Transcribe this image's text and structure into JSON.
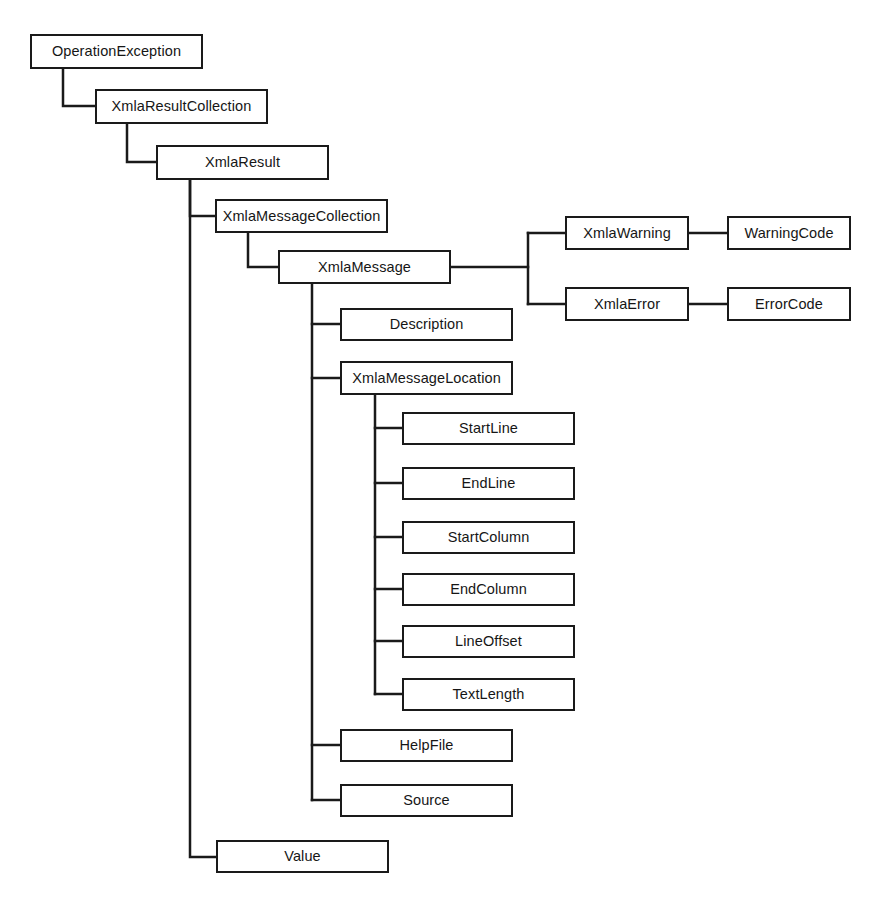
{
  "diagram": {
    "kind": "class-hierarchy-tree",
    "background_color": "#ffffff",
    "line_color": "#1a1a1a",
    "box_border_color": "#1a1a1a",
    "box_fill_color": "#ffffff",
    "text_color": "#161616",
    "nodes": [
      {
        "id": "operation-exception",
        "label": "OperationException",
        "x": 30,
        "y": 34,
        "w": 173,
        "h": 35
      },
      {
        "id": "xmla-result-collection",
        "label": "XmlaResultCollection",
        "x": 95,
        "y": 89,
        "w": 173,
        "h": 35
      },
      {
        "id": "xmla-result",
        "label": "XmlaResult",
        "x": 156,
        "y": 145,
        "w": 173,
        "h": 35
      },
      {
        "id": "xmla-message-collection",
        "label": "XmlaMessageCollection",
        "x": 215,
        "y": 199,
        "w": 173,
        "h": 34
      },
      {
        "id": "xmla-message",
        "label": "XmlaMessage",
        "x": 278,
        "y": 250,
        "w": 173,
        "h": 34
      },
      {
        "id": "xmla-warning",
        "label": "XmlaWarning",
        "x": 565,
        "y": 216,
        "w": 124,
        "h": 34
      },
      {
        "id": "warning-code",
        "label": "WarningCode",
        "x": 727,
        "y": 216,
        "w": 124,
        "h": 34
      },
      {
        "id": "xmla-error",
        "label": "XmlaError",
        "x": 565,
        "y": 287,
        "w": 124,
        "h": 34
      },
      {
        "id": "error-code",
        "label": "ErrorCode",
        "x": 727,
        "y": 287,
        "w": 124,
        "h": 34
      },
      {
        "id": "description",
        "label": "Description",
        "x": 340,
        "y": 308,
        "w": 173,
        "h": 33
      },
      {
        "id": "xmla-message-location",
        "label": "XmlaMessageLocation",
        "x": 340,
        "y": 361,
        "w": 173,
        "h": 34
      },
      {
        "id": "start-line",
        "label": "StartLine",
        "x": 402,
        "y": 412,
        "w": 173,
        "h": 33
      },
      {
        "id": "end-line",
        "label": "EndLine",
        "x": 402,
        "y": 467,
        "w": 173,
        "h": 33
      },
      {
        "id": "start-column",
        "label": "StartColumn",
        "x": 402,
        "y": 521,
        "w": 173,
        "h": 33
      },
      {
        "id": "end-column",
        "label": "EndColumn",
        "x": 402,
        "y": 573,
        "w": 173,
        "h": 33
      },
      {
        "id": "line-offset",
        "label": "LineOffset",
        "x": 402,
        "y": 625,
        "w": 173,
        "h": 33
      },
      {
        "id": "text-length",
        "label": "TextLength",
        "x": 402,
        "y": 678,
        "w": 173,
        "h": 33
      },
      {
        "id": "help-file",
        "label": "HelpFile",
        "x": 340,
        "y": 729,
        "w": 173,
        "h": 33
      },
      {
        "id": "source",
        "label": "Source",
        "x": 340,
        "y": 784,
        "w": 173,
        "h": 33
      },
      {
        "id": "value",
        "label": "Value",
        "x": 216,
        "y": 840,
        "w": 173,
        "h": 33
      }
    ],
    "connectors": [
      {
        "id": "operation-exception-to-xmla-result-collection",
        "points": "63,69 63,106 95,106"
      },
      {
        "id": "xmla-result-collection-to-xmla-result",
        "points": "127,124 127,162 156,162"
      },
      {
        "id": "xmla-result-to-xmla-message-collection",
        "points": "190,180 190,216 215,216"
      },
      {
        "id": "xmla-result-to-value",
        "points": "190,180 190,857 216,857"
      },
      {
        "id": "xmla-message-collection-to-xmla-message",
        "points": "248,233 248,267 278,267"
      },
      {
        "id": "xmla-message-to-branch-split",
        "points": "451,267 528,267"
      },
      {
        "id": "branch-split-vertical",
        "points": "528,233 528,304"
      },
      {
        "id": "branch-to-xmla-warning",
        "points": "528,233 565,233"
      },
      {
        "id": "branch-to-xmla-error",
        "points": "528,304 565,304"
      },
      {
        "id": "xmla-warning-to-warning-code",
        "points": "689,233 727,233"
      },
      {
        "id": "xmla-error-to-error-code",
        "points": "689,304 727,304"
      },
      {
        "id": "xmla-message-trunk",
        "points": "312,284 312,800"
      },
      {
        "id": "trunk-to-description",
        "points": "312,324 340,324"
      },
      {
        "id": "trunk-to-xmla-message-location",
        "points": "312,378 340,378"
      },
      {
        "id": "trunk-to-help-file",
        "points": "312,745 340,745"
      },
      {
        "id": "trunk-to-source",
        "points": "312,800 340,800"
      },
      {
        "id": "xmla-message-location-trunk",
        "points": "375,395 375,694"
      },
      {
        "id": "location-to-start-line",
        "points": "375,428 402,428"
      },
      {
        "id": "location-to-end-line",
        "points": "375,483 402,483"
      },
      {
        "id": "location-to-start-column",
        "points": "375,537 402,537"
      },
      {
        "id": "location-to-end-column",
        "points": "375,589 402,589"
      },
      {
        "id": "location-to-line-offset",
        "points": "375,641 402,641"
      },
      {
        "id": "location-to-text-length",
        "points": "375,694 402,694"
      }
    ]
  }
}
